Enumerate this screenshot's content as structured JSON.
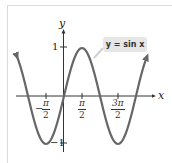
{
  "chart_data": {
    "type": "line",
    "title": "",
    "function": "y = sin x",
    "series": [
      {
        "name": "y = sin x",
        "x": [
          -3.14159,
          -2.35619,
          -1.5708,
          -0.7854,
          0,
          0.7854,
          1.5708,
          2.35619,
          3.14159,
          3.92699,
          4.71239,
          5.49779,
          6.28319
        ],
        "values": [
          0,
          -0.7071,
          -1,
          -0.7071,
          0,
          0.7071,
          1,
          0.7071,
          0,
          -0.7071,
          -1,
          -0.7071,
          0
        ]
      }
    ],
    "xlabel": "x",
    "ylabel": "y",
    "x_ticks": [
      "-π/2",
      "π/2",
      "3π/2"
    ],
    "y_ticks": [
      "1",
      "-1"
    ],
    "xlim": [
      -3.6,
      7.0
    ],
    "ylim": [
      -1.3,
      1.5
    ],
    "grid": false,
    "legend": "callout label",
    "curve_color": "#666666"
  },
  "labels": {
    "y_axis": "y",
    "x_axis": "x",
    "y_one": "1",
    "y_neg_one": "−1",
    "tick_neg_half_pi": {
      "sign": "−",
      "num": "π",
      "den": "2"
    },
    "tick_half_pi": {
      "num": "π",
      "den": "2"
    },
    "tick_three_half_pi": {
      "num": "3π",
      "den": "2"
    },
    "callout": "y = sin x"
  }
}
